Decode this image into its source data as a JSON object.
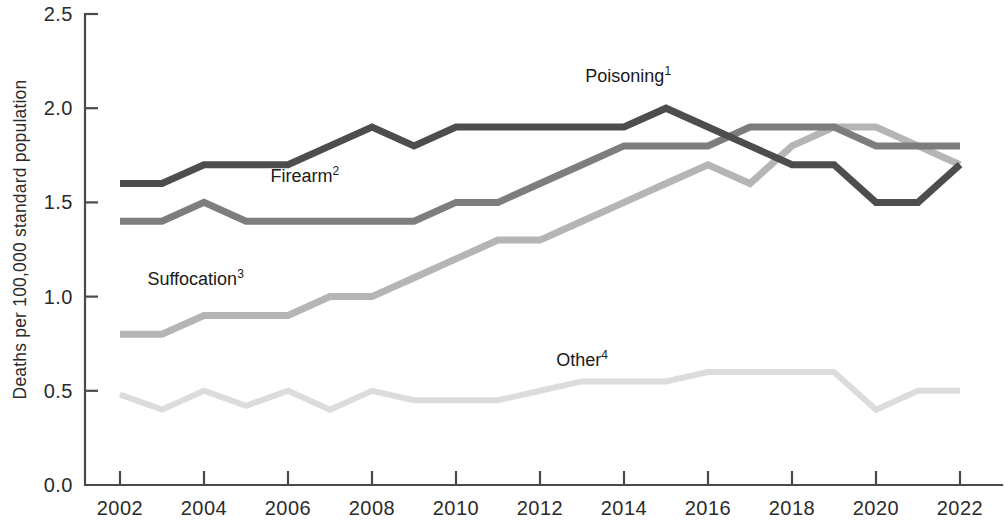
{
  "chart_data": {
    "type": "line",
    "title": "",
    "xlabel": "",
    "ylabel": "Deaths per 100,000 standard population",
    "x": [
      2002,
      2003,
      2004,
      2005,
      2006,
      2007,
      2008,
      2009,
      2010,
      2011,
      2012,
      2013,
      2014,
      2015,
      2016,
      2017,
      2018,
      2019,
      2020,
      2021,
      2022
    ],
    "xtick_labels": [
      "2002",
      "2004",
      "2006",
      "2008",
      "2010",
      "2012",
      "2014",
      "2016",
      "2018",
      "2020",
      "2022"
    ],
    "xtick_values": [
      2002,
      2004,
      2006,
      2008,
      2010,
      2012,
      2014,
      2016,
      2018,
      2020,
      2022
    ],
    "ytick_labels": [
      "0.0",
      "0.5",
      "1.0",
      "1.5",
      "2.0",
      "2.5"
    ],
    "ytick_values": [
      0.0,
      0.5,
      1.0,
      1.5,
      2.0,
      2.5
    ],
    "xlim": [
      2002,
      2022
    ],
    "ylim": [
      0.0,
      2.5
    ],
    "grid": false,
    "legend": "inline-annotations",
    "series": [
      {
        "name": "Poisoning",
        "label": "Poisoning",
        "footnote": "1",
        "color": "#4d4d4d",
        "width": 7,
        "annotation": {
          "x": 2014.1,
          "y": 2.14
        },
        "values": [
          1.6,
          1.6,
          1.7,
          1.7,
          1.7,
          1.8,
          1.9,
          1.8,
          1.9,
          1.9,
          1.9,
          1.9,
          1.9,
          2.0,
          1.9,
          1.8,
          1.7,
          1.7,
          1.5,
          1.5,
          1.7
        ]
      },
      {
        "name": "Firearm",
        "label": "Firearm",
        "footnote": "2",
        "color": "#7d7d7d",
        "width": 7,
        "annotation": {
          "x": 2006.4,
          "y": 1.61
        },
        "values": [
          1.4,
          1.4,
          1.5,
          1.4,
          1.4,
          1.4,
          1.4,
          1.4,
          1.5,
          1.5,
          1.6,
          1.7,
          1.8,
          1.8,
          1.8,
          1.9,
          1.9,
          1.9,
          1.8,
          1.8,
          1.8
        ]
      },
      {
        "name": "Suffocation",
        "label": "Suffocation",
        "footnote": "3",
        "color": "#b5b5b5",
        "width": 7,
        "annotation": {
          "x": 2003.8,
          "y": 1.06
        },
        "values": [
          0.8,
          0.8,
          0.9,
          0.9,
          0.9,
          1.0,
          1.0,
          1.1,
          1.2,
          1.3,
          1.3,
          1.4,
          1.5,
          1.6,
          1.7,
          1.6,
          1.8,
          1.9,
          1.9,
          1.8,
          1.7
        ]
      },
      {
        "name": "Other",
        "label": "Other",
        "footnote": "4",
        "color": "#dcdcdc",
        "width": 6,
        "annotation": {
          "x": 2013.0,
          "y": 0.63
        },
        "values": [
          0.48,
          0.4,
          0.5,
          0.42,
          0.5,
          0.4,
          0.5,
          0.45,
          0.45,
          0.45,
          0.5,
          0.55,
          0.55,
          0.55,
          0.6,
          0.6,
          0.6,
          0.6,
          0.4,
          0.5,
          0.5
        ]
      }
    ]
  },
  "axes": {
    "y_axis_title": "Deaths per 100,000 standard population"
  }
}
